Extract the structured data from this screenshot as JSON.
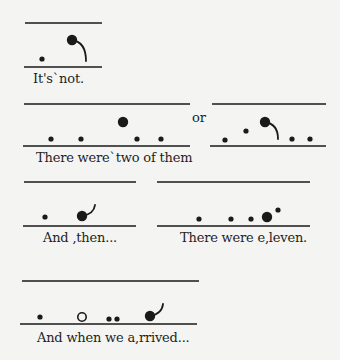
{
  "colors": {
    "background": "#f4f4f2",
    "ink": "#1a1a1a"
  },
  "connector": {
    "label": "or",
    "x": 192,
    "y": 118
  },
  "figures": [
    {
      "id": "its-not",
      "caption": "It's`not.",
      "caption_x": 33,
      "caption_y": 71,
      "lines": [
        {
          "x1": 25,
          "y1": 23,
          "x2": 102,
          "y2": 23
        },
        {
          "x1": 24,
          "y1": 67,
          "x2": 102,
          "y2": 67
        }
      ],
      "dots": [
        {
          "cx": 42,
          "cy": 59,
          "r": 2.6,
          "fill": "solid"
        },
        {
          "cx": 72,
          "cy": 40,
          "r": 5.2,
          "fill": "solid",
          "tail": "M72,40 Q86,42 86,61"
        }
      ]
    },
    {
      "id": "there-were-two-of-them",
      "caption": "There were`two of them",
      "caption_x": 36,
      "caption_y": 150,
      "lines": [
        {
          "x1": 24,
          "y1": 104,
          "x2": 190,
          "y2": 104
        },
        {
          "x1": 23,
          "y1": 146,
          "x2": 190,
          "y2": 146
        }
      ],
      "dots": [
        {
          "cx": 51,
          "cy": 139,
          "r": 2.6,
          "fill": "solid"
        },
        {
          "cx": 81,
          "cy": 139,
          "r": 2.6,
          "fill": "solid"
        },
        {
          "cx": 123,
          "cy": 122,
          "r": 5.2,
          "fill": "solid"
        },
        {
          "cx": 137,
          "cy": 139,
          "r": 2.6,
          "fill": "solid"
        },
        {
          "cx": 161,
          "cy": 139,
          "r": 2.6,
          "fill": "solid"
        }
      ]
    },
    {
      "id": "there-were-two-of-them-alt",
      "caption": "",
      "caption_x": 0,
      "caption_y": 0,
      "lines": [
        {
          "x1": 212,
          "y1": 104,
          "x2": 326,
          "y2": 104
        },
        {
          "x1": 210,
          "y1": 146,
          "x2": 326,
          "y2": 146
        }
      ],
      "dots": [
        {
          "cx": 225,
          "cy": 140,
          "r": 2.6,
          "fill": "solid"
        },
        {
          "cx": 246,
          "cy": 131,
          "r": 2.6,
          "fill": "solid"
        },
        {
          "cx": 265,
          "cy": 122,
          "r": 5.2,
          "fill": "solid",
          "tail": "M265,122 Q278,124 278,139"
        },
        {
          "cx": 292,
          "cy": 139,
          "r": 2.6,
          "fill": "solid"
        },
        {
          "cx": 310,
          "cy": 139,
          "r": 2.6,
          "fill": "solid"
        }
      ]
    },
    {
      "id": "and-then",
      "caption": "And ,then...",
      "caption_x": 43,
      "caption_y": 230,
      "lines": [
        {
          "x1": 24,
          "y1": 182,
          "x2": 136,
          "y2": 182
        },
        {
          "x1": 23,
          "y1": 226,
          "x2": 136,
          "y2": 226
        }
      ],
      "dots": [
        {
          "cx": 45,
          "cy": 217,
          "r": 2.6,
          "fill": "solid"
        },
        {
          "cx": 82,
          "cy": 216,
          "r": 5.2,
          "fill": "solid",
          "tail": "M82,216 Q94,214 95,205"
        }
      ]
    },
    {
      "id": "there-were-eleven",
      "caption": "There were e,leven.",
      "caption_x": 180,
      "caption_y": 230,
      "lines": [
        {
          "x1": 157,
          "y1": 182,
          "x2": 310,
          "y2": 182
        },
        {
          "x1": 157,
          "y1": 226,
          "x2": 310,
          "y2": 226
        }
      ],
      "dots": [
        {
          "cx": 199,
          "cy": 219,
          "r": 2.6,
          "fill": "solid"
        },
        {
          "cx": 231,
          "cy": 219,
          "r": 2.6,
          "fill": "solid"
        },
        {
          "cx": 251,
          "cy": 219,
          "r": 2.6,
          "fill": "solid"
        },
        {
          "cx": 267,
          "cy": 217,
          "r": 5.2,
          "fill": "solid"
        },
        {
          "cx": 278,
          "cy": 210,
          "r": 2.6,
          "fill": "solid"
        }
      ]
    },
    {
      "id": "and-when-we-arrived",
      "caption": "And when we a,rrived...",
      "caption_x": 37,
      "caption_y": 330,
      "lines": [
        {
          "x1": 22,
          "y1": 281,
          "x2": 199,
          "y2": 281
        },
        {
          "x1": 20,
          "y1": 324,
          "x2": 197,
          "y2": 324
        }
      ],
      "dots": [
        {
          "cx": 40,
          "cy": 317,
          "r": 2.6,
          "fill": "solid"
        },
        {
          "cx": 82,
          "cy": 317,
          "r": 4.2,
          "fill": "open"
        },
        {
          "cx": 109,
          "cy": 319,
          "r": 2.6,
          "fill": "solid"
        },
        {
          "cx": 117,
          "cy": 319,
          "r": 2.6,
          "fill": "solid"
        },
        {
          "cx": 150,
          "cy": 316,
          "r": 5.2,
          "fill": "solid",
          "tail": "M150,316 Q162,314 163,304"
        }
      ]
    }
  ]
}
